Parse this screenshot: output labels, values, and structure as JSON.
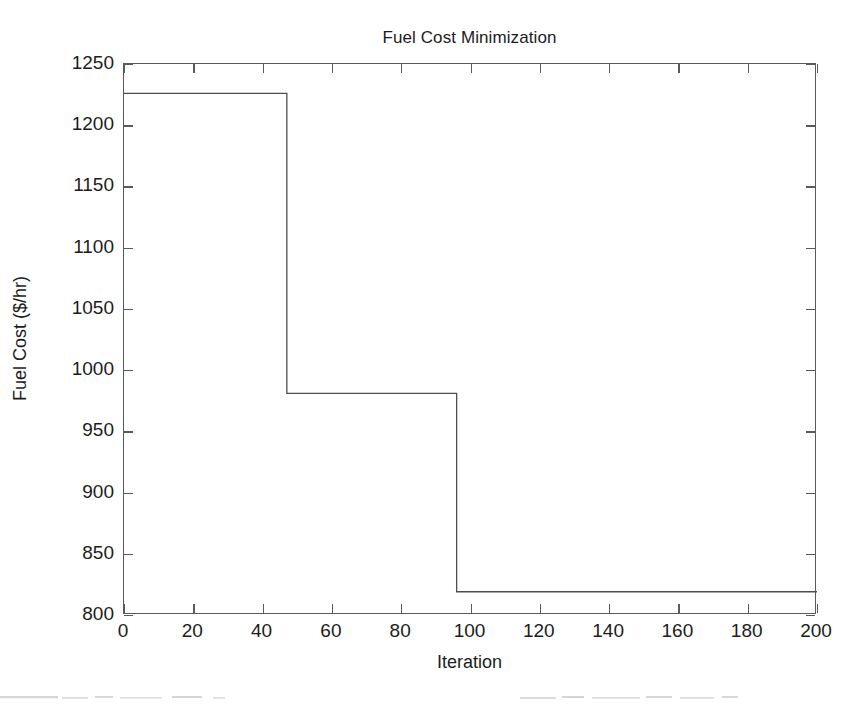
{
  "chart_data": {
    "type": "line",
    "title": "Fuel Cost Minimization",
    "xlabel": "Iteration",
    "ylabel": "Fuel Cost ($/hr)",
    "xlim": [
      0,
      200
    ],
    "ylim": [
      800,
      1250
    ],
    "xticks": [
      0,
      20,
      40,
      60,
      80,
      100,
      120,
      140,
      160,
      180,
      200
    ],
    "yticks": [
      800,
      850,
      900,
      950,
      1000,
      1050,
      1100,
      1150,
      1200,
      1250
    ],
    "grid": false,
    "legend": null,
    "line_color": "#4a4f52",
    "line_width": 1.3,
    "series": [
      {
        "name": "Fuel Cost",
        "style": "step",
        "x": [
          0,
          47,
          47,
          96,
          96,
          200
        ],
        "y": [
          1226,
          1226,
          981,
          981,
          819,
          819
        ]
      }
    ],
    "annotations": []
  }
}
